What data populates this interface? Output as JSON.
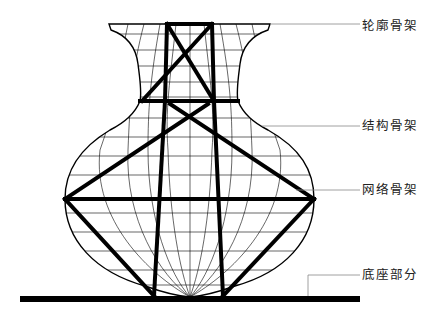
{
  "diagram": {
    "type": "vase-skeleton-structure",
    "labels": [
      {
        "id": "contour",
        "text": "轮廓骨架",
        "y": 19,
        "leader_from": [
          270,
          24
        ],
        "leader_to": [
          360,
          24
        ]
      },
      {
        "id": "structure",
        "text": "结构骨架",
        "y": 119,
        "leader_from": [
          262,
          126
        ],
        "leader_to": [
          360,
          126
        ]
      },
      {
        "id": "grid",
        "text": "网络骨架",
        "y": 183,
        "leader_from": [
          296,
          190
        ],
        "leader_to": [
          360,
          190
        ]
      },
      {
        "id": "base",
        "text": "底座部分",
        "y": 268,
        "leader_from": [
          308,
          296
        ],
        "leader_to": [
          360,
          275
        ]
      }
    ],
    "colors": {
      "stroke": "#000000",
      "leader": "#888888",
      "label": "#222222",
      "background": "#ffffff"
    }
  }
}
